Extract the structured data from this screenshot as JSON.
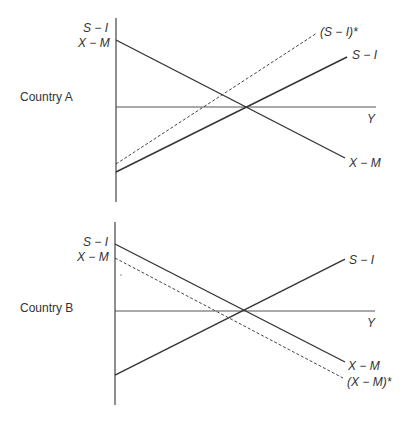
{
  "colors": {
    "line": "#333333",
    "text": "#333333",
    "background": "#ffffff"
  },
  "panels": [
    {
      "country_label": "Country A",
      "axis_labels": {
        "top1": "S − I",
        "top2": "X − M"
      },
      "curves": [
        {
          "name": "X − M",
          "style": "solid",
          "from": [
            116,
            40
          ],
          "to": [
            345,
            158
          ],
          "label": "X − M"
        },
        {
          "name": "S − I",
          "style": "solid",
          "from": [
            116,
            172
          ],
          "to": [
            347,
            57
          ],
          "label": "S − I"
        },
        {
          "name": "(S − I)*",
          "style": "dashed",
          "from": [
            116,
            164
          ],
          "to": [
            317,
            33
          ],
          "label": "(S − I)*"
        }
      ],
      "horizontal_axis_label": "Y",
      "equilibrium": [
        244,
        107
      ]
    },
    {
      "country_label": "Country B",
      "axis_labels": {
        "top1": "S − I",
        "top2": "X − M"
      },
      "curves": [
        {
          "name": "X − M",
          "style": "solid",
          "from": [
            115,
            244
          ],
          "to": [
            345,
            362
          ],
          "label": "X − M"
        },
        {
          "name": "S − I",
          "style": "solid",
          "from": [
            115,
            375
          ],
          "to": [
            345,
            259
          ],
          "label": "S − I"
        },
        {
          "name": "(X − M)*",
          "style": "dashed",
          "from": [
            115,
            258
          ],
          "to": [
            343,
            378
          ],
          "label": "(X − M)*"
        }
      ],
      "horizontal_axis_label": "Y",
      "equilibrium": [
        243,
        311
      ]
    }
  ]
}
